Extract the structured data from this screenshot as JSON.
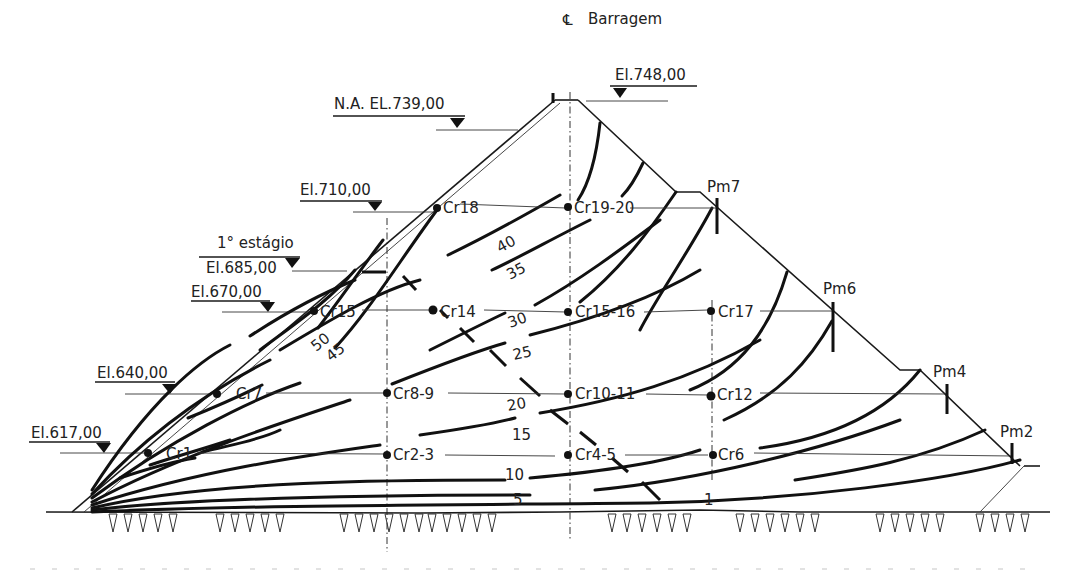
{
  "diagram": {
    "type": "dam-cross-section",
    "centerline": {
      "symbol": "℄",
      "label": "Barragem"
    },
    "elevations": [
      {
        "label": "El.748,00",
        "side": "downstream"
      },
      {
        "label": "N.A. EL.739,00",
        "side": "upstream"
      },
      {
        "label": "El.710,00",
        "side": "upstream"
      },
      {
        "label": "1° estágio",
        "side": "upstream"
      },
      {
        "label": "El.685,00",
        "side": "upstream"
      },
      {
        "label": "El.670,00",
        "side": "upstream"
      },
      {
        "label": "El.640,00",
        "side": "upstream"
      },
      {
        "label": "El.617,00",
        "side": "upstream"
      }
    ],
    "piezometers": [
      {
        "label": "Cr18"
      },
      {
        "label": "Cr19-20"
      },
      {
        "label": "Cr15"
      },
      {
        "label": "Cr14"
      },
      {
        "label": "Cr15-16"
      },
      {
        "label": "Cr17"
      },
      {
        "label": "Cr7"
      },
      {
        "label": "Cr8-9"
      },
      {
        "label": "Cr10-11"
      },
      {
        "label": "Cr12"
      },
      {
        "label": "Cr1"
      },
      {
        "label": "Cr2-3"
      },
      {
        "label": "Cr4-5"
      },
      {
        "label": "Cr6"
      }
    ],
    "surface_marks": [
      {
        "label": "Pm7"
      },
      {
        "label": "Pm6"
      },
      {
        "label": "Pm4"
      },
      {
        "label": "Pm2"
      }
    ],
    "contour_labels": [
      "50",
      "45",
      "40",
      "35",
      "30",
      "25",
      "20",
      "15",
      "10",
      "5",
      "1"
    ],
    "colors": {
      "line": "#111111",
      "text": "#222222",
      "background": "#ffffff"
    }
  }
}
